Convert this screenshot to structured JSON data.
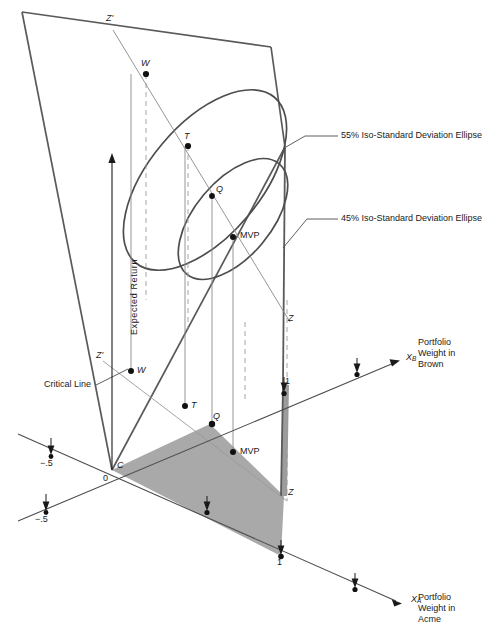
{
  "figure": {
    "kind": "portfolio-3d-diagram",
    "colors": {
      "line": "#4d4d4d",
      "heavy_line": "#5a5a5a",
      "thin_line": "#8a8a8a",
      "dashed": "#9a9a9a",
      "shade_fill": "#a9a9a9",
      "strip_fill": "#9c9c9c",
      "text": "#1a1a1a"
    }
  },
  "callouts": {
    "ellipse_outer": "55% Iso-Standard Deviation Ellipse",
    "ellipse_inner": "45% Iso-Standard Deviation Ellipse",
    "critical_line": "Critical Line"
  },
  "axes": {
    "vertical_label": "Expected Return",
    "xb": {
      "symbol": "X",
      "subscript": "B",
      "title_line1": "Portfolio",
      "title_line2": "Weight in",
      "title_line3": "Brown",
      "tick_one": "1",
      "tick_neg_half": "−.5"
    },
    "xa": {
      "symbol": "X",
      "subscript": "A",
      "title_line1": "Portfolio",
      "title_line2": "Weight in",
      "title_line3": "Acme",
      "tick_one": "1",
      "tick_neg_half": "−.5"
    },
    "origin": "0"
  },
  "points": {
    "upper": [
      {
        "id": "W",
        "label": "W",
        "italic": true
      },
      {
        "id": "T",
        "label": "T",
        "italic": true
      },
      {
        "id": "Q",
        "label": "Q",
        "italic": true
      },
      {
        "id": "MVP",
        "label": "MVP",
        "italic": false
      }
    ],
    "lower": [
      {
        "id": "W2",
        "label": "W",
        "italic": true
      },
      {
        "id": "T2",
        "label": "T",
        "italic": true
      },
      {
        "id": "Q2",
        "label": "Q",
        "italic": true
      },
      {
        "id": "MVP2",
        "label": "MVP",
        "italic": false
      },
      {
        "id": "C",
        "label": "C",
        "italic": true
      }
    ],
    "critical_line_ends": {
      "z_top": "Z'",
      "z_plane": "Z",
      "z_low_top": "Z'",
      "z_low_bottom": "Z"
    }
  }
}
